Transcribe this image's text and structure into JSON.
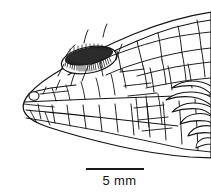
{
  "figure": {
    "type": "scientific-line-drawing",
    "background_color": "#ffffff",
    "line_color": "#141414",
    "fill_color": "#ffffff"
  },
  "scalebar": {
    "label": "5 mm",
    "value": 5,
    "unit": "mm",
    "bar_color": "#1a1a1a",
    "bar_length_px": 58
  },
  "anatomy": {
    "eye": {
      "name": "eye",
      "shading": "dense radial hatching",
      "fill_color": "#2b2b2b"
    },
    "nostril": {
      "name": "nostril",
      "shape": "small circle"
    },
    "scales": {
      "name": "head scales",
      "pattern": "polygonal tessellation"
    },
    "neck_scales": {
      "name": "neck scales",
      "pattern": "overlapping imbricate rows"
    }
  }
}
